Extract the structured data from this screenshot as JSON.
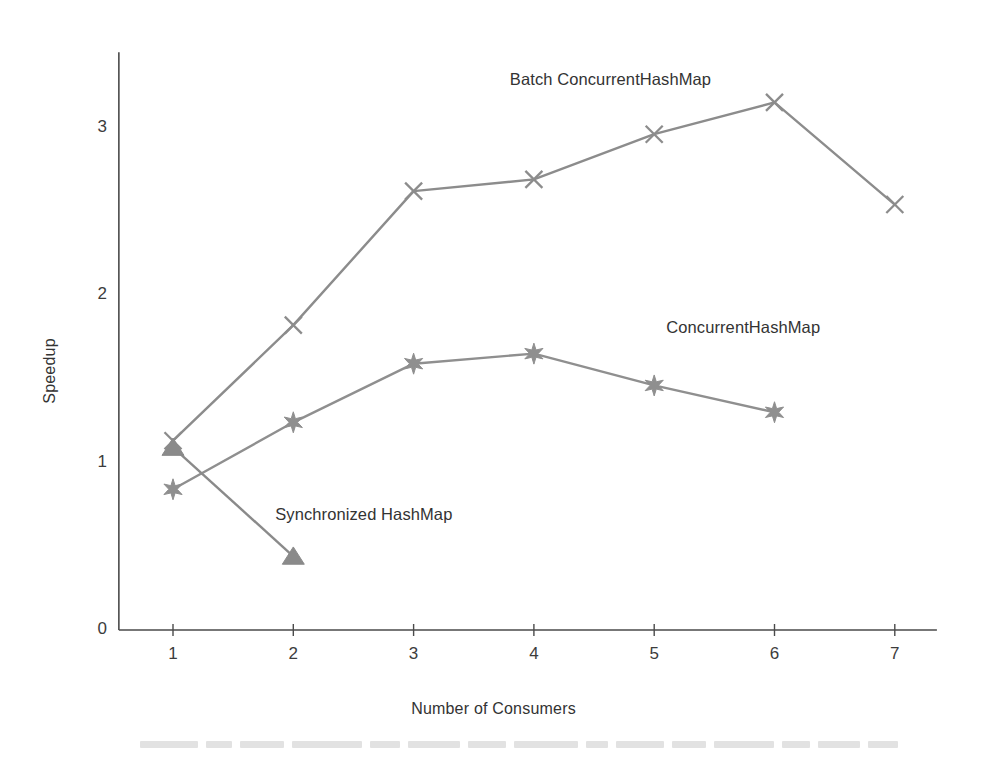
{
  "chart_data": {
    "type": "line",
    "title": "",
    "xlabel": "Number of Consumers",
    "ylabel": "Speedup",
    "x": [
      1,
      2,
      3,
      4,
      5,
      6,
      7
    ],
    "xlim": [
      0.55,
      7.35
    ],
    "ylim": [
      0,
      3.45
    ],
    "xticks": [
      "1",
      "2",
      "3",
      "4",
      "5",
      "6",
      "7"
    ],
    "yticks": [
      "0",
      "1",
      "2",
      "3"
    ],
    "grid": false,
    "legend_position": "inline-annotations",
    "series": [
      {
        "name": "Batch ConcurrentHashMap",
        "marker": "x",
        "color": "#8c8c8c",
        "x": [
          1,
          2,
          3,
          4,
          5,
          6,
          7
        ],
        "values": [
          1.13,
          1.82,
          2.62,
          2.69,
          2.96,
          3.15,
          2.54
        ],
        "label_x": 3.8,
        "label_y": 3.28
      },
      {
        "name": "ConcurrentHashMap",
        "marker": "star",
        "color": "#8f8f8f",
        "x": [
          1,
          2,
          3,
          4,
          5,
          6
        ],
        "values": [
          0.84,
          1.24,
          1.59,
          1.65,
          1.46,
          1.3
        ],
        "label_x": 5.1,
        "label_y": 1.8
      },
      {
        "name": "Synchronized HashMap",
        "marker": "triangle",
        "color": "#8a8a8a",
        "x": [
          1,
          2
        ],
        "values": [
          1.09,
          0.44
        ],
        "label_x": 1.85,
        "label_y": 0.68
      }
    ]
  },
  "axis": {
    "x_title": "Number of Consumers",
    "y_title": "Speedup"
  }
}
